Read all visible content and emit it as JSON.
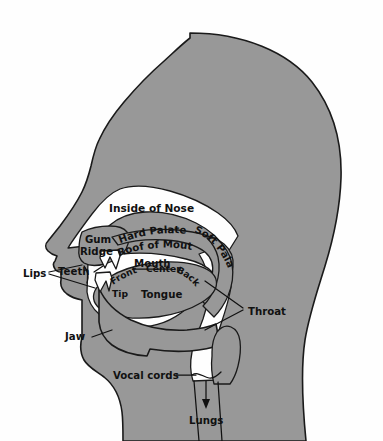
{
  "diagram": {
    "title": "Inside of Nose",
    "colors": {
      "tissue_fill": "#989898",
      "cavity_fill": "#ffffff",
      "outline": "#1a1a1a",
      "text": "#111111",
      "background": "#ffffff"
    },
    "labels": {
      "inside_of_nose": "Inside of Nose",
      "gum": "Gum",
      "ridge": "Ridge",
      "hard_palate": "Hard Palate",
      "soft_palate": "Soft Palate",
      "roof_of_mouth": "Roof of Mouth",
      "mouth": "Mouth",
      "front": "Front",
      "center": "Center",
      "back": "Back",
      "tip": "Tip",
      "tongue": "Tongue",
      "lips": "Lips",
      "teeth": "Teeth",
      "jaw": "Jaw",
      "throat": "Throat",
      "vocal_cords": "Vocal cords",
      "lungs": "Lungs"
    }
  }
}
